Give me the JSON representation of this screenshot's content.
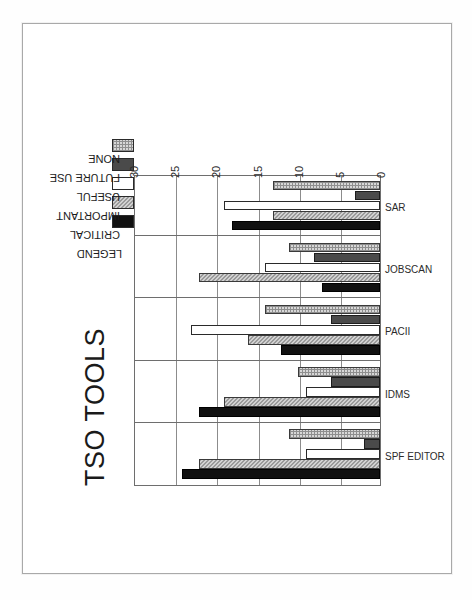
{
  "document": {
    "page_background": "#ffffff",
    "frame_color": "#a9a9a9"
  },
  "chart_data": {
    "type": "bar",
    "title": "TSO TOOLS",
    "xlabel": "",
    "ylabel": "",
    "ylim": [
      0,
      30
    ],
    "yticks": [
      "0",
      "5",
      "10",
      "15",
      "20",
      "25",
      "30"
    ],
    "grid": true,
    "orientation": "rotated-90-clockwise",
    "legend_position": "top-right",
    "legend_title": "LEGEND",
    "categories": [
      "SPF EDITOR",
      "IDMS",
      "PACII",
      "JOBSCAN",
      "SAR"
    ],
    "series": [
      {
        "name": "CRITICAL",
        "color": "#111111",
        "pattern": "solid-black",
        "values": [
          24,
          22,
          12,
          7,
          18
        ]
      },
      {
        "name": "IMPORTANT",
        "color": "#9a9a9a",
        "pattern": "hatch-gray",
        "values": [
          22,
          19,
          16,
          22,
          13
        ]
      },
      {
        "name": "USEFUL",
        "color": "#ffffff",
        "pattern": "white",
        "values": [
          9,
          9,
          23,
          14,
          19
        ]
      },
      {
        "name": "FUTURE USE",
        "color": "#4a4a4a",
        "pattern": "dark-gray",
        "values": [
          2,
          6,
          6,
          8,
          3
        ]
      },
      {
        "name": "NONE",
        "color": "#d7d7d7",
        "pattern": "grid-light",
        "values": [
          11,
          10,
          14,
          11,
          13
        ]
      }
    ]
  }
}
